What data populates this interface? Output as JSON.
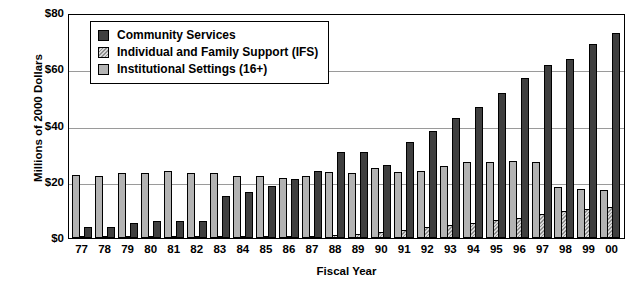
{
  "chart_data": {
    "type": "bar",
    "title": "",
    "xlabel": "Fiscal Year",
    "ylabel": "Millions of 2000 Dollars",
    "ylim": [
      0,
      80
    ],
    "yticks": [
      0,
      20,
      40,
      60,
      80
    ],
    "ytick_labels": [
      "$0",
      "$20",
      "$40",
      "$60",
      "$80"
    ],
    "grid": true,
    "legend_position": "top-left-inside",
    "categories": [
      "77",
      "78",
      "79",
      "80",
      "81",
      "82",
      "83",
      "84",
      "85",
      "86",
      "87",
      "88",
      "89",
      "90",
      "91",
      "92",
      "93",
      "94",
      "95",
      "96",
      "97",
      "98",
      "99",
      "00"
    ],
    "series": [
      {
        "name": "Community Services",
        "color": "#3f3f3f",
        "values": [
          4.0,
          4.0,
          5.5,
          6.0,
          6.0,
          6.0,
          15.0,
          16.5,
          18.5,
          21.0,
          24.0,
          30.5,
          30.5,
          26.0,
          34.0,
          38.0,
          42.5,
          46.5,
          51.5,
          57.0,
          61.5,
          63.5,
          69.0,
          73.0
        ]
      },
      {
        "name": "Individual and Family Support (IFS)",
        "color": "#d9d9d9",
        "values": [
          0.3,
          0.3,
          0.4,
          0.4,
          0.4,
          0.5,
          0.5,
          0.6,
          0.6,
          0.7,
          0.8,
          1.0,
          1.5,
          2.2,
          3.0,
          4.0,
          4.8,
          5.5,
          6.3,
          7.2,
          8.5,
          9.5,
          10.3,
          11.0
        ]
      },
      {
        "name": "Institutional Settings (16+)",
        "color": "#b3b3b3",
        "values": [
          22.5,
          22.0,
          23.0,
          23.0,
          24.0,
          23.0,
          23.0,
          22.0,
          22.0,
          21.5,
          22.0,
          23.5,
          23.0,
          25.0,
          23.5,
          24.0,
          25.5,
          27.0,
          27.0,
          27.5,
          27.0,
          18.0,
          17.5,
          17.0
        ]
      }
    ]
  },
  "legend": {
    "items": [
      {
        "label": "Community Services",
        "swatch": "cs-swatch"
      },
      {
        "label": "Individual and Family Support (IFS)",
        "swatch": "ifs-swatch"
      },
      {
        "label": "Institutional Settings (16+)",
        "swatch": "inst-swatch"
      }
    ]
  },
  "axes": {
    "y_title": "Millions of 2000 Dollars",
    "x_title": "Fiscal Year"
  }
}
